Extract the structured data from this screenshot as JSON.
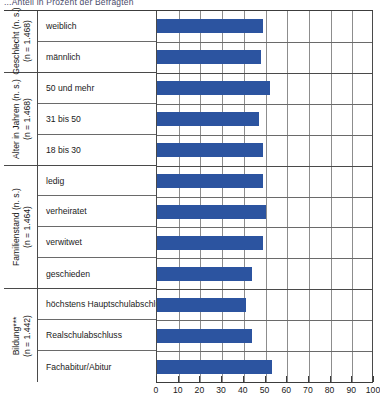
{
  "top_caption": "...Anteil in Prozent der Befragten",
  "chart_data": {
    "type": "bar",
    "orientation": "horizontal",
    "title": "",
    "xlabel": "",
    "ylabel": "",
    "xlim": [
      0,
      100
    ],
    "xticks": [
      0,
      10,
      20,
      30,
      40,
      50,
      60,
      70,
      80,
      90,
      100
    ],
    "grid": true,
    "legend": "none",
    "bar_color": "#2c54a0",
    "groups": [
      {
        "name": "Geschlecht (n. s.)",
        "label_line1": "Geschlecht (n. s.)",
        "label_line2": "(n = 1.468)",
        "categories": [
          "weiblich",
          "männlich"
        ],
        "values": [
          49,
          48
        ]
      },
      {
        "name": "Alter in Jahren (n. s.)",
        "label_line1": "Alter in Jahren (n. s.)",
        "label_line2": "(n = 1.468)",
        "categories": [
          "50 und mehr",
          "31 bis 50",
          "18 bis 30"
        ],
        "values": [
          52,
          47,
          49
        ]
      },
      {
        "name": "Familienstand (n. s.)",
        "label_line1": "Familienstand (n. s.)",
        "label_line2": "(n = 1.464)",
        "categories": [
          "ledig",
          "verheiratet",
          "verwitwet",
          "geschieden"
        ],
        "values": [
          49,
          50,
          49,
          44
        ]
      },
      {
        "name": "Bildung***",
        "label_line1": "Bildung***",
        "label_line2": "(n = 1.442)",
        "categories": [
          "höchstens Hauptschulabschluss",
          "Realschulabschluss",
          "Fachabitur/Abitur"
        ],
        "values": [
          41,
          44,
          53
        ]
      }
    ]
  }
}
